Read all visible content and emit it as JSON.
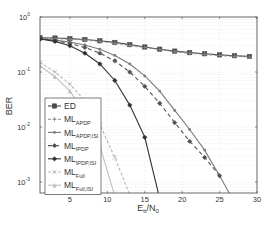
{
  "chart_data": {
    "type": "line",
    "title": "",
    "xlabel": "Eb/N0",
    "xlabel_main": "E",
    "xlabel_sub1": "b",
    "xlabel_mid": "/N",
    "xlabel_sub2": "0",
    "ylabel": "BER",
    "xscale": "linear",
    "yscale": "log",
    "xlim": [
      1,
      30
    ],
    "ylim": [
      0.0005,
      1
    ],
    "grid": true,
    "legend_position": "lower left",
    "x_ticks": [
      5,
      10,
      15,
      20,
      25,
      30
    ],
    "y_ticks": [
      {
        "value": 1,
        "label_base": "10",
        "label_exp": "0"
      },
      {
        "value": 0.1,
        "label_base": "10",
        "label_exp": "-1"
      },
      {
        "value": 0.01,
        "label_base": "10",
        "label_exp": "-2"
      },
      {
        "value": 0.001,
        "label_base": "10",
        "label_exp": "-3"
      }
    ],
    "series": [
      {
        "name": "ED",
        "label_main": "ML",
        "label_text": "ED",
        "label_sub": "",
        "color": "#4a4a4a",
        "dash": "",
        "marker": "square",
        "x": [
          1,
          3,
          5,
          7,
          9,
          11,
          13,
          15,
          17,
          19,
          21,
          23,
          25,
          27,
          29
        ],
        "values": [
          0.42,
          0.415,
          0.405,
          0.39,
          0.37,
          0.345,
          0.315,
          0.285,
          0.26,
          0.24,
          0.225,
          0.215,
          0.205,
          0.198,
          0.192
        ]
      },
      {
        "name": "ML_APDP",
        "label_main": "ML",
        "label_sub": "APDP",
        "color": "#8a8a8a",
        "dash": "3,2",
        "marker": "plus",
        "x": [
          1,
          3,
          5,
          7,
          9,
          11,
          13,
          15,
          17,
          19,
          21,
          23,
          25,
          27,
          29
        ],
        "values": [
          0.41,
          0.405,
          0.395,
          0.38,
          0.36,
          0.335,
          0.305,
          0.28,
          0.255,
          0.235,
          0.22,
          0.21,
          0.2,
          0.193,
          0.188
        ]
      },
      {
        "name": "ML_APDP,ISI",
        "label_main": "ML",
        "label_sub": "APDP,ISI",
        "color": "#7a7a7a",
        "dash": "",
        "marker": "dot",
        "x": [
          1,
          3,
          5,
          7,
          9,
          11,
          13,
          15,
          17,
          19,
          21,
          23,
          25,
          26.7
        ],
        "values": [
          0.4,
          0.38,
          0.35,
          0.31,
          0.26,
          0.2,
          0.14,
          0.085,
          0.045,
          0.02,
          0.009,
          0.0038,
          0.0013,
          0.0005
        ]
      },
      {
        "name": "ML_IPDP",
        "label_main": "ML",
        "label_sub": "IPDP",
        "color": "#555555",
        "dash": "4,3",
        "marker": "star",
        "x": [
          1,
          3,
          5,
          7,
          9,
          11,
          13,
          15,
          17,
          19,
          21,
          23,
          25
        ],
        "values": [
          0.4,
          0.37,
          0.33,
          0.28,
          0.22,
          0.16,
          0.1,
          0.055,
          0.027,
          0.012,
          0.0055,
          0.0028,
          0.0013
        ]
      },
      {
        "name": "ML_IPDP,ISI",
        "label_main": "ML",
        "label_sub": "IPDP,ISI",
        "color": "#333333",
        "dash": "",
        "marker": "star",
        "x": [
          1,
          3,
          5,
          7,
          9,
          11,
          13,
          15,
          17
        ],
        "values": [
          0.4,
          0.36,
          0.3,
          0.22,
          0.14,
          0.07,
          0.025,
          0.0065,
          0.0005
        ]
      },
      {
        "name": "ML_Full",
        "label_main": "ML",
        "label_sub": "Full",
        "color": "#b5b5b5",
        "dash": "3,2",
        "marker": "cross",
        "x": [
          1,
          3,
          5,
          7,
          9,
          11,
          13.2
        ],
        "values": [
          0.15,
          0.1,
          0.06,
          0.03,
          0.011,
          0.0028,
          0.0005
        ]
      },
      {
        "name": "ML_Full,ISI",
        "label_main": "ML",
        "label_sub": "Full,ISI",
        "color": "#c0c0c0",
        "dash": "",
        "marker": "triangle",
        "x": [
          1,
          3,
          5,
          7,
          9,
          11.1
        ],
        "values": [
          0.13,
          0.082,
          0.045,
          0.018,
          0.0045,
          0.0005
        ]
      }
    ]
  }
}
